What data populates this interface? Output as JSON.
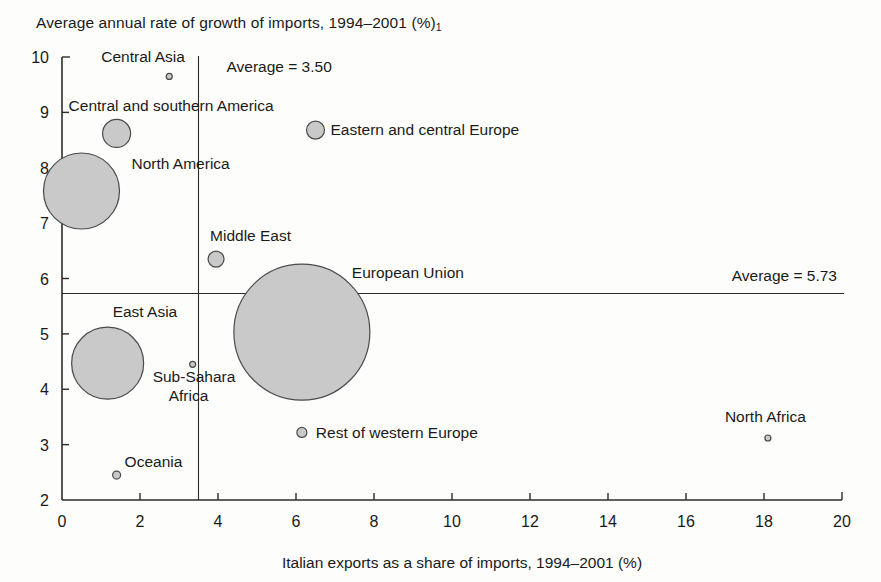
{
  "chart_data": {
    "type": "scatter",
    "title": "Average annual rate of growth of imports, 1994–2001 (%)",
    "title_subscript": "1",
    "xlabel": "Italian exports as a share of imports, 1994–2001 (%)",
    "ylabel": "",
    "xlim": [
      0,
      20
    ],
    "ylim": [
      2,
      10
    ],
    "xticks": [
      "0",
      "2",
      "4",
      "6",
      "8",
      "10",
      "12",
      "14",
      "16",
      "18",
      "20"
    ],
    "yticks": [
      "2",
      "3",
      "4",
      "5",
      "6",
      "7",
      "8",
      "9",
      "10"
    ],
    "grid": false,
    "legend": "none",
    "bubble_fill": "#c9c9c9",
    "bubble_stroke": "#4a4a4a",
    "annotations": [
      {
        "name": "vertical-average",
        "text": "Average = 3.50",
        "value": 3.5,
        "orientation": "vertical"
      },
      {
        "name": "horizontal-average",
        "text": "Average = 5.73",
        "value": 5.73,
        "orientation": "horizontal"
      }
    ],
    "points": [
      {
        "label": "Central Asia",
        "x": 2.75,
        "y": 9.65,
        "r": 3,
        "label_dx": -68,
        "label_dy": -14,
        "anchor": "start"
      },
      {
        "label": "Central and southern America",
        "x": 1.4,
        "y": 8.62,
        "r": 14,
        "label_dx": -48,
        "label_dy": -22,
        "anchor": "start"
      },
      {
        "label": "Eastern and central Europe",
        "x": 6.5,
        "y": 8.68,
        "r": 9,
        "label_dx": 15,
        "label_dy": 5,
        "anchor": "start"
      },
      {
        "label": "North America",
        "x": 0.5,
        "y": 7.58,
        "r": 38,
        "label_dx": 50,
        "label_dy": -22,
        "anchor": "start"
      },
      {
        "label": "Middle East",
        "x": 3.95,
        "y": 6.35,
        "r": 8,
        "label_dx": -6,
        "label_dy": -18,
        "anchor": "start"
      },
      {
        "label": "European Union",
        "x": 6.15,
        "y": 5.03,
        "r": 68,
        "label_dx": 50,
        "label_dy": -54,
        "anchor": "start"
      },
      {
        "label": "East Asia",
        "x": 1.17,
        "y": 4.47,
        "r": 36,
        "label_dx": 5,
        "label_dy": -46,
        "anchor": "start"
      },
      {
        "label": "Sub-Sahara Africa",
        "x": 3.35,
        "y": 4.45,
        "r": 3,
        "label_dx": -40,
        "label_dy": 18,
        "anchor": "start"
      },
      {
        "label": "Rest of western Europe",
        "x": 6.15,
        "y": 3.22,
        "r": 5,
        "label_dx": 14,
        "label_dy": 6,
        "anchor": "start"
      },
      {
        "label": "North Africa",
        "x": 18.1,
        "y": 3.12,
        "r": 3,
        "label_dx": -43,
        "label_dy": -16,
        "anchor": "start"
      },
      {
        "label": "Oceania",
        "x": 1.4,
        "y": 2.45,
        "r": 4,
        "label_dx": 8,
        "label_dy": -8,
        "anchor": "start"
      }
    ],
    "multiline_labels": {
      "Sub-Sahara Africa": [
        "Sub-Sahara",
        "Africa"
      ]
    }
  }
}
